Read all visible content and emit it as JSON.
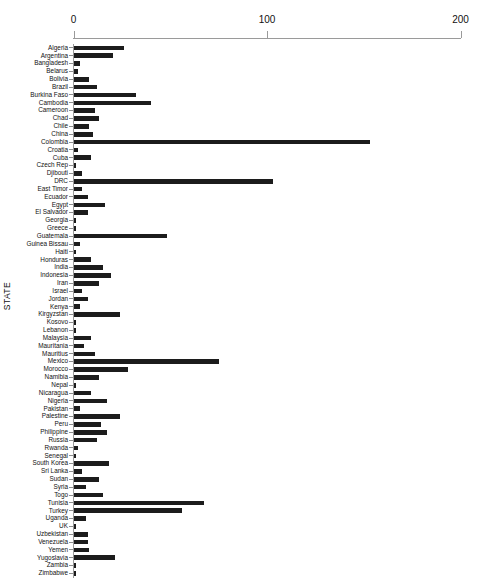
{
  "chart_data": {
    "type": "bar",
    "orientation": "horizontal",
    "title": "",
    "xlabel": "",
    "ylabel": "STATE",
    "xlim": [
      0,
      200
    ],
    "xticks": [
      0,
      100,
      200
    ],
    "xtick_labels": [
      "0",
      "100",
      "200"
    ],
    "grid": false,
    "legend": null,
    "bar_color": "#1c1c1c",
    "axis_color": "#9a9a9a",
    "categories": [
      "Algeria",
      "Argentina",
      "Bangladesh",
      "Belarus",
      "Bolivia",
      "Brazil",
      "Burkina Faso",
      "Cambodia",
      "Cameroon",
      "Chad",
      "Chile",
      "China",
      "Colombia",
      "Croatia",
      "Cuba",
      "Czech Rep",
      "Djibouti",
      "DRC",
      "East Timor",
      "Ecuador",
      "Egypt",
      "El Salvador",
      "Georgia",
      "Greece",
      "Guatemala",
      "Guinea Bissau",
      "Haiti",
      "Honduras",
      "India",
      "Indonesia",
      "Iran",
      "Israel",
      "Jordan",
      "Kenya",
      "Kirgyzstan",
      "Kosovo",
      "Lebanon",
      "Malaysia",
      "Mauritania",
      "Mauritius",
      "Mexico",
      "Morocco",
      "Namibia",
      "Nepal",
      "Nicaragua",
      "Nigeria",
      "Pakistan",
      "Palestine",
      "Peru",
      "Philippine",
      "Russia",
      "Rwanda",
      "Senegal",
      "South Korea",
      "Sri Lanka",
      "Sudan",
      "Syria",
      "Togo",
      "Tunisia",
      "Turkey",
      "Uganda",
      "UK",
      "Uzbekistan",
      "Venezuela",
      "Yemen",
      "Yugoslavia",
      "Zambia",
      "Zimbabwe"
    ],
    "values": [
      26,
      20,
      3,
      2,
      8,
      12,
      32,
      40,
      11,
      13,
      8,
      10,
      153,
      2,
      9,
      1,
      4,
      103,
      4,
      7,
      16,
      7,
      1,
      1,
      48,
      3,
      1,
      9,
      15,
      19,
      13,
      4,
      7,
      3,
      24,
      1,
      1,
      9,
      5,
      11,
      75,
      28,
      13,
      1,
      9,
      17,
      3,
      24,
      14,
      17,
      12,
      2,
      1,
      18,
      4,
      13,
      6,
      15,
      67,
      56,
      6,
      1,
      7,
      7,
      8,
      21,
      1,
      1
    ]
  }
}
